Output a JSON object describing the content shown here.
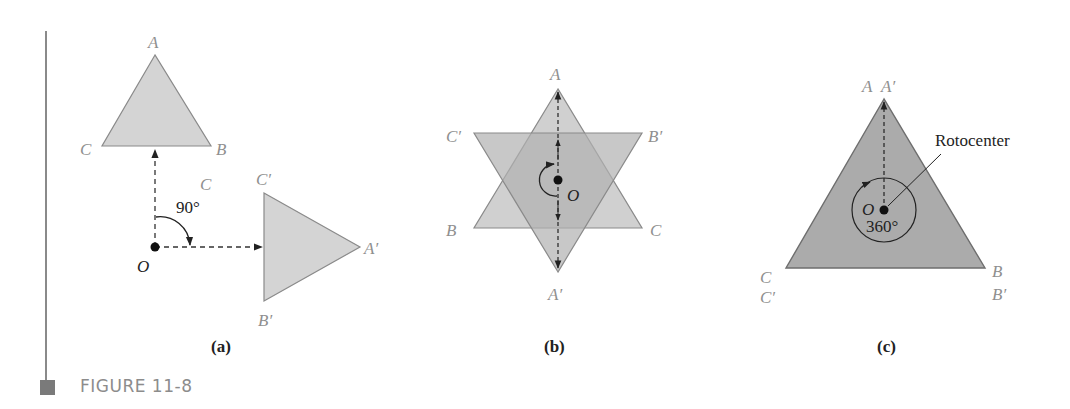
{
  "figure": {
    "label": "FIGURE 11-8",
    "rule_color": "#8a8a8a",
    "fill_light": "#d4d4d4",
    "fill_dark": "#a8a8a8",
    "stroke": "#7a7a7a"
  },
  "panels": [
    {
      "id": "a",
      "caption": "(a)",
      "vertices_original": {
        "A": "A",
        "B": "B",
        "C": "C"
      },
      "vertices_image": {
        "A": "A′",
        "B": "B′",
        "C": "C′"
      },
      "extra_label": "C",
      "center": "O",
      "angle": "90°"
    },
    {
      "id": "b",
      "caption": "(b)",
      "vertices_original": {
        "A": "A",
        "B": "B",
        "C": "C"
      },
      "vertices_image": {
        "A": "A′",
        "B": "B′",
        "C": "C′"
      },
      "center": "O"
    },
    {
      "id": "c",
      "caption": "(c)",
      "vertices_original": {
        "A": "A",
        "B": "B",
        "C": "C"
      },
      "vertices_image": {
        "A": "A′",
        "B": "B′",
        "C": "C′"
      },
      "center": "O",
      "angle": "360°",
      "annotation": "Rotocenter"
    }
  ]
}
